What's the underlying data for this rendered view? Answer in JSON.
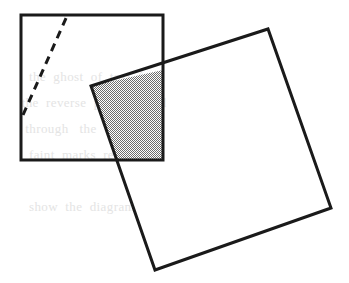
{
  "figure": {
    "caption": "",
    "width": 349,
    "height": 283,
    "background_color": "#ffffff",
    "stroke_color": "#1a1a1a",
    "shade_color": "#b0b0b0",
    "bleed_text_color": "#e4e4e4"
  },
  "shapes": {
    "upright_square": {
      "name": "upright-square",
      "points": "21,15 163,15 163,160 21,160",
      "stroke_width": 3,
      "fill": "none"
    },
    "tilted_square": {
      "name": "tilted-square",
      "points": "91,86 268,29 331,208 155,270",
      "stroke_width": 3,
      "fill": "none"
    },
    "overlap_region": {
      "name": "shaded-overlap-region",
      "points": "91,86 163,70 163,160 118,160",
      "fill_pattern": "checker-gray"
    },
    "dashed_line": {
      "name": "dashed-line",
      "x1": 23,
      "y1": 115,
      "x2": 67,
      "y2": 16,
      "stroke_width": 3,
      "dash_pattern": "8 6"
    }
  },
  "bleed_text": {
    "lines": [
      "",
      "   the  ghost  of  text  from",
      " the  reverse  page  printed",
      "  through   the    paper",
      "   faint  marks  remain",
      "",
      "   show  the  diagram"
    ]
  }
}
